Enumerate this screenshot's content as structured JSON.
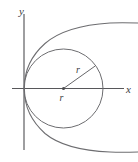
{
  "figure": {
    "type": "analytic-geometry-diagram",
    "background_color": "#ffffff",
    "curve_color": "#6d6d70",
    "axis_color": "#57575a",
    "label_color": "#3b3b3e",
    "axes": {
      "x_label": "x",
      "y_label": "y",
      "origin_px": [
        24,
        88.5
      ],
      "x_axis_extent_px": [
        12,
        124
      ],
      "y_axis_extent_px": [
        14,
        150
      ],
      "x_label_position_px": [
        128,
        92
      ],
      "y_label_position_px": [
        22,
        12
      ]
    },
    "circle": {
      "name": "circle-of-radius-r",
      "center_px": [
        63.5,
        88.5
      ],
      "radius_px": 39.5,
      "tangent_point": "origin",
      "radius_segment": {
        "from_px": [
          63.5,
          88.5
        ],
        "to_px": [
          95.5,
          65.5
        ]
      },
      "labels": [
        {
          "text": "r",
          "role": "radius-on-segment",
          "position_px": [
            79,
            70
          ]
        },
        {
          "text": "r",
          "role": "radius-below-center",
          "position_px": [
            62,
            99
          ]
        }
      ]
    },
    "parabola": {
      "name": "rightward-parabola",
      "vertex_px": [
        24,
        88.5
      ],
      "opens": "right",
      "upper_arm_end_px": [
        138,
        23
      ],
      "lower_arm_end_px": [
        138,
        152
      ]
    },
    "center_marker": {
      "name": "circle-center-dot",
      "position_px": [
        63.5,
        88.5
      ]
    }
  }
}
